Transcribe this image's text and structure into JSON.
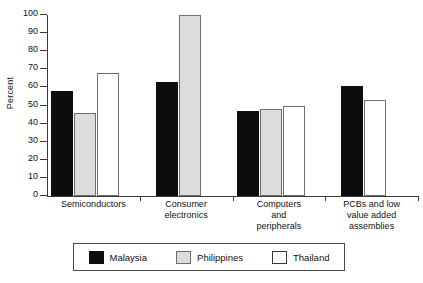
{
  "chart_data": {
    "type": "bar",
    "title": "",
    "subtitle": "",
    "xlabel": "",
    "ylabel": "Percent",
    "ylim": [
      0,
      100
    ],
    "yticks": [
      0,
      10,
      20,
      30,
      40,
      50,
      60,
      70,
      80,
      90,
      100
    ],
    "ytick_labels": [
      "0",
      "10",
      "20",
      "30",
      "40",
      "50",
      "60",
      "70",
      "80",
      "90",
      "100"
    ],
    "grid": false,
    "legend_position": "bottom",
    "categories": [
      "Semiconductors",
      "Consumer electronics",
      "Computers and peripherals",
      "PCBs and low value added assemblies"
    ],
    "category_label_lines": [
      [
        "Semiconductors"
      ],
      [
        "Consumer",
        "electronics"
      ],
      [
        "Computers",
        "and",
        "peripherals"
      ],
      [
        "PCBs and low",
        "value added",
        "assemblies"
      ]
    ],
    "series": [
      {
        "name": "Malaysia",
        "color": "#0d0d0d",
        "values": [
          58,
          63,
          47,
          61
        ]
      },
      {
        "name": "Philippines",
        "color": "#dcdcdc",
        "values": [
          46,
          100,
          48,
          null
        ]
      },
      {
        "name": "Thailand",
        "color": "#ffffff",
        "values": [
          68,
          null,
          50,
          53
        ]
      }
    ]
  },
  "legend": {
    "items": [
      {
        "label": "Malaysia",
        "swatch": "legend-swatch-malaysia"
      },
      {
        "label": "Philippines",
        "swatch": "legend-swatch-philippines"
      },
      {
        "label": "Thailand",
        "swatch": "legend-swatch-thailand"
      }
    ]
  }
}
